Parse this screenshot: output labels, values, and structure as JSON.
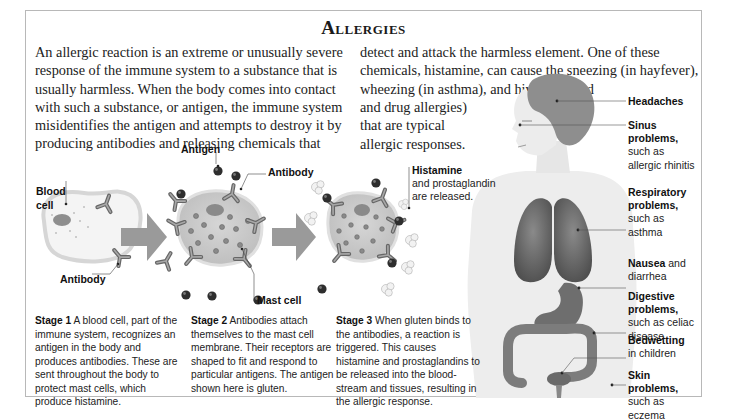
{
  "title": "Allergies",
  "intro": {
    "left": "An allergic reaction is an extreme or unusually severe response of the immune system to a substance that is usually harmless. When the body comes into contact with such a substance, or antigen, the immune system misidentifies the antigen and attempts to destroy it by producing antibodies and releasing chemicals that",
    "right_top": "detect and attack the harmless element. One of these chemicals, histamine, can cause the sneezing (in hayfever), wheezing (in asthma), and hives (in food",
    "right_bottom": "and drug allergies) that are typical allergic responses."
  },
  "diagram_labels": {
    "blood_cell": "Blood cell",
    "antibody_1": "Antibody",
    "antigen": "Antigen",
    "antibody_2": "Antibody",
    "mast_cell": "Mast cell",
    "histamine_bold": "Histamine",
    "histamine_rest": "and prostaglandin are released."
  },
  "stages": [
    {
      "label": "Stage 1",
      "text": "A blood cell, part of the immune system, recognizes an antigen in the body and produces antibodies. These are sent throughout the body to protect mast cells, which produce histamine."
    },
    {
      "label": "Stage 2",
      "text": "Antibodies attach themselves to the mast cell membrane. Their receptors are shaped to fit and respond to particular antigens. The antigen shown here is gluten."
    },
    {
      "label": "Stage 3",
      "text": "When gluten binds to the antibodies, a reaction is triggered. This causes histamine and prostaglandins to be released into the blood-stream and tissues, resulting in the allergic response."
    }
  ],
  "symptoms": [
    {
      "bold": "Headaches",
      "rest": ""
    },
    {
      "bold": "Sinus problems,",
      "rest": "such as allergic rhinitis"
    },
    {
      "bold": "Respiratory problems,",
      "rest": "such as asthma"
    },
    {
      "bold": "Nausea",
      "rest": "and diarrhea"
    },
    {
      "bold": "Digestive problems,",
      "rest": "such as celiac disease"
    },
    {
      "bold": "Bedwetting",
      "rest": "in children"
    },
    {
      "bold": "Skin problems,",
      "rest": "such as eczema"
    }
  ],
  "colors": {
    "frame_border": "#b8b8b8",
    "arrow": "#9a9a9a",
    "cell_fill": "#cfcfcf",
    "cell_edge": "#e8e8e8",
    "antigen": "#333333",
    "organ": "#6e6e6e",
    "body": "#ececec"
  }
}
